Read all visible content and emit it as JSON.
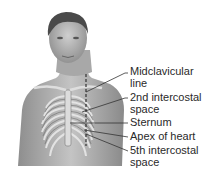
{
  "figure": {
    "labels": [
      {
        "lines": [
          "Midclavicular",
          "line"
        ],
        "top": 66
      },
      {
        "lines": [
          "2nd intercostal",
          "space"
        ],
        "top": 92
      },
      {
        "lines": [
          "Sternum"
        ],
        "top": 117
      },
      {
        "lines": [
          "Apex of heart"
        ],
        "top": 131
      },
      {
        "lines": [
          "5th intercostal",
          "space"
        ],
        "top": 145
      }
    ]
  }
}
